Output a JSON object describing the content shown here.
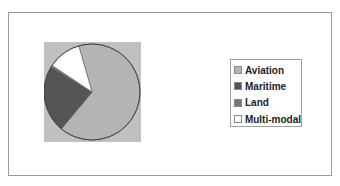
{
  "chart_data": {
    "type": "pie",
    "title": "",
    "categories": [
      "Aviation",
      "Maritime",
      "Land",
      "Multi-modal"
    ],
    "values": [
      65.5,
      22.5,
      0.8,
      11.2
    ],
    "unit": "percent (estimated from slice angles)",
    "start_angle_deg": 344,
    "direction": "clockwise",
    "colors": [
      "#b4b4b4",
      "#555555",
      "#777777",
      "#ffffff"
    ],
    "plot_background": "#c0c0c0",
    "legend_position": "right",
    "grid": false
  },
  "legend": {
    "items": [
      {
        "label": "Aviation",
        "color": "#b4b4b4"
      },
      {
        "label": "Maritime",
        "color": "#555555"
      },
      {
        "label": "Land",
        "color": "#777777"
      },
      {
        "label": "Multi-modal",
        "color": "#ffffff"
      }
    ]
  }
}
